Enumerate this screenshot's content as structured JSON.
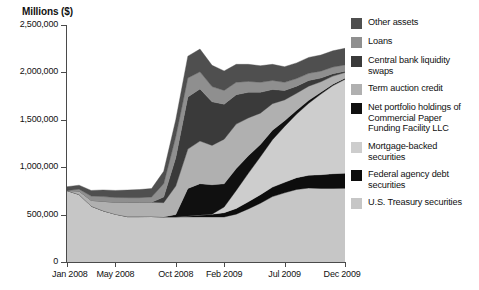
{
  "chart_data": {
    "type": "area",
    "title": "",
    "subtitle": "",
    "ylabel": "Millions ($)",
    "xlabel": "",
    "ylim": [
      0,
      2500000
    ],
    "grid": false,
    "stacked": true,
    "legend_position": "right",
    "ytick_labels": [
      "2,500,000",
      "2,000,000",
      "1,500,000",
      "1,000,000",
      "500,000",
      "0"
    ],
    "ytick_values": [
      2500000,
      2000000,
      1500000,
      1000000,
      500000,
      0
    ],
    "xtick_labels": [
      "Jan 2008",
      "May 2008",
      "Oct 2008",
      "Feb 2009",
      "Jul 2009",
      "Dec 2009"
    ],
    "xtick_positions": [
      0,
      4,
      9,
      13,
      18,
      23
    ],
    "x": [
      "Jan 2008",
      "Feb 2008",
      "Mar 2008",
      "Apr 2008",
      "May 2008",
      "Jun 2008",
      "Jul 2008",
      "Aug 2008",
      "Sep 2008",
      "Oct 2008",
      "Nov 2008",
      "Dec 2008",
      "Jan 2009",
      "Feb 2009",
      "Mar 2009",
      "Apr 2009",
      "May 2009",
      "Jun 2009",
      "Jul 2009",
      "Aug 2009",
      "Sep 2009",
      "Oct 2009",
      "Nov 2009",
      "Dec 2009"
    ],
    "series": [
      {
        "name": "U.S. Treasury securities",
        "color": "#c6c6c6",
        "values": [
          754000,
          713000,
          590000,
          540000,
          505000,
          479000,
          479000,
          480000,
          476000,
          476000,
          476000,
          476000,
          475000,
          475000,
          505000,
          560000,
          620000,
          690000,
          730000,
          765000,
          780000,
          776000,
          776000,
          777000
        ]
      },
      {
        "name": "Federal agency debt securities",
        "color": "#0d0d0d",
        "values": [
          0,
          0,
          0,
          0,
          0,
          0,
          0,
          0,
          0,
          0,
          10000,
          20000,
          30000,
          45000,
          60000,
          75000,
          90000,
          100000,
          110000,
          125000,
          135000,
          145000,
          155000,
          160000
        ]
      },
      {
        "name": "Mortgage-backed securities",
        "color": "#cdcdcd",
        "values": [
          0,
          0,
          0,
          0,
          0,
          0,
          0,
          0,
          0,
          0,
          0,
          0,
          0,
          60000,
          190000,
          300000,
          400000,
          500000,
          590000,
          670000,
          760000,
          850000,
          930000,
          990000
        ]
      },
      {
        "name": "Net portfolio holdings of Commercial Paper Funding Facility LLC",
        "color": "#101010",
        "values": [
          0,
          0,
          0,
          0,
          0,
          0,
          0,
          0,
          0,
          25000,
          290000,
          330000,
          310000,
          245000,
          230000,
          185000,
          130000,
          100000,
          60000,
          40000,
          30000,
          20000,
          15000,
          12000
        ]
      },
      {
        "name": "Term auction credit",
        "color": "#b0b0b0",
        "values": [
          0,
          35000,
          60000,
          100000,
          125000,
          150000,
          150000,
          150000,
          150000,
          300000,
          415000,
          450000,
          415000,
          470000,
          470000,
          400000,
          330000,
          280000,
          220000,
          180000,
          150000,
          110000,
          85000,
          60000
        ]
      },
      {
        "name": "Central bank liquidity swaps",
        "color": "#3a3a3a",
        "values": [
          0,
          0,
          0,
          0,
          0,
          0,
          0,
          0,
          60000,
          300000,
          550000,
          550000,
          460000,
          370000,
          310000,
          270000,
          220000,
          150000,
          100000,
          75000,
          60000,
          40000,
          25000,
          12000
        ]
      },
      {
        "name": "Loans",
        "color": "#8f8f8f",
        "values": [
          0,
          20000,
          45000,
          50000,
          50000,
          50000,
          50000,
          55000,
          140000,
          220000,
          200000,
          180000,
          160000,
          145000,
          130000,
          115000,
          105000,
          95000,
          85000,
          80000,
          75000,
          72000,
          70000,
          68000
        ]
      },
      {
        "name": "Other assets",
        "color": "#4f4f4f",
        "values": [
          40000,
          42000,
          60000,
          70000,
          75000,
          80000,
          85000,
          90000,
          130000,
          180000,
          230000,
          240000,
          225000,
          205000,
          190000,
          180000,
          175000,
          170000,
          165000,
          165000,
          168000,
          170000,
          172000,
          175000
        ]
      }
    ],
    "legend_order": [
      "Other assets",
      "Loans",
      "Central bank liquidity swaps",
      "Term auction credit",
      "Net portfolio holdings of Commercial Paper Funding Facility LLC",
      "Mortgage-backed securities",
      "Federal agency debt securities",
      "U.S. Treasury securities"
    ]
  },
  "legend": {
    "items": [
      {
        "label": "Other assets",
        "color": "#4f4f4f"
      },
      {
        "label": "Loans",
        "color": "#8f8f8f"
      },
      {
        "label": "Central bank liquidity swaps",
        "color": "#3a3a3a"
      },
      {
        "label": "Term auction credit",
        "color": "#b0b0b0"
      },
      {
        "label": "Net portfolio holdings of Commercial Paper Funding Facility LLC",
        "color": "#101010"
      },
      {
        "label": "Mortgage-backed securities",
        "color": "#cdcdcd"
      },
      {
        "label": "Federal agency debt securities",
        "color": "#0d0d0d"
      },
      {
        "label": "U.S. Treasury securities",
        "color": "#c6c6c6"
      }
    ]
  }
}
